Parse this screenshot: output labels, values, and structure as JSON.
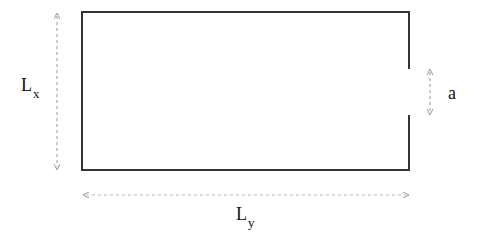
{
  "diagram": {
    "type": "rectangular domain with opening",
    "labels": {
      "height": {
        "main": "L",
        "sub": "x"
      },
      "width": {
        "main": "L",
        "sub": "y"
      },
      "opening": {
        "main": "a"
      }
    },
    "colors": {
      "boundary": "#333333",
      "dimension_arrow": "#aaaaaa",
      "text": "#111111"
    }
  }
}
